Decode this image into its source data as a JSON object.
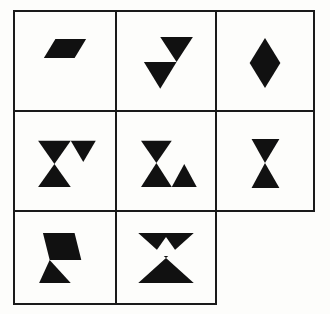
{
  "puzzle": {
    "title": "Shape Matrix",
    "type": "visual-analogy-matrix",
    "rows": 3,
    "columns": 3,
    "total_slots": 9,
    "filled_cells": 8,
    "missing_cell": "row3-col3",
    "ink_color": "#111111",
    "border_color": "#1a1a1a",
    "background_color": "#fdfdfb",
    "cells": [
      {
        "id": "r1c1",
        "row": 1,
        "column": 1,
        "label": "parallelogram",
        "description": "Single small right-leaning parallelogram",
        "shape_count": 1
      },
      {
        "id": "r1c2",
        "row": 1,
        "column": 2,
        "label": "two-down-triangles-offset",
        "description": "Two downward triangles offset diagonally, upper-right and lower-left",
        "shape_count": 2
      },
      {
        "id": "r1c3",
        "row": 1,
        "column": 3,
        "label": "vertical-diamond",
        "description": "Tall vertical diamond / rhombus",
        "shape_count": 1
      },
      {
        "id": "r2c1",
        "row": 2,
        "column": 1,
        "label": "hourglass-with-right-triangle",
        "description": "Hourglass on left plus downward triangle at upper right",
        "shape_count": 2
      },
      {
        "id": "r2c2",
        "row": 2,
        "column": 2,
        "label": "hourglass-with-right-up-triangle",
        "description": "Hourglass on left plus upward triangle at lower right",
        "shape_count": 2
      },
      {
        "id": "r2c3",
        "row": 2,
        "column": 3,
        "label": "hourglass",
        "description": "Plain narrow hourglass bowtie",
        "shape_count": 1
      },
      {
        "id": "r3c1",
        "row": 3,
        "column": 1,
        "label": "parallelogram-over-triangle",
        "description": "Right-leaning parallelogram above an upward triangle meeting at a point",
        "shape_count": 2
      },
      {
        "id": "r3c2",
        "row": 3,
        "column": 2,
        "label": "wide-hourglass-with-notch",
        "description": "Wide solid hourglass with white upward triangular cutout in upper half",
        "shape_count": 1
      },
      {
        "id": "r3c3",
        "row": 3,
        "column": 3,
        "label": "empty-missing-cell",
        "description": "Missing answer cell, no border and no figure",
        "shape_count": 0
      }
    ]
  }
}
